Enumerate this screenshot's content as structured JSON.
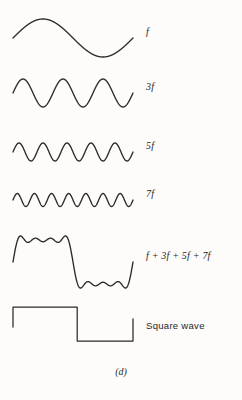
{
  "figure": {
    "caption": "(d)",
    "background_color": "#fdfcfa",
    "stroke_color": "#2a2a2a"
  },
  "chart_data": {
    "type": "line",
    "title": "",
    "subtitle": "",
    "xlabel": "",
    "ylabel": "",
    "grid": false,
    "legend_position": "right",
    "axis_visible": false,
    "x_range": [
      0,
      1
    ],
    "x_pixel_range": [
      13,
      133
    ],
    "traces": [
      {
        "name": "f",
        "label": "f",
        "label_style": "italic",
        "kind": "sine",
        "harmonics": [
          1
        ],
        "cycles": 1,
        "amplitude": 19,
        "baseline_y": 38,
        "label_x": 146,
        "label_y": 33
      },
      {
        "name": "3f",
        "label": "3f",
        "label_style": "italic",
        "kind": "sine",
        "harmonics": [
          3
        ],
        "cycles": 3,
        "amplitude": 14,
        "baseline_y": 93,
        "label_x": 146,
        "label_y": 88
      },
      {
        "name": "5f",
        "label": "5f",
        "label_style": "italic",
        "kind": "sine",
        "harmonics": [
          5
        ],
        "cycles": 5,
        "amplitude": 9,
        "baseline_y": 152,
        "label_x": 146,
        "label_y": 147
      },
      {
        "name": "7f",
        "label": "7f",
        "label_style": "italic",
        "kind": "sine",
        "harmonics": [
          7
        ],
        "cycles": 7,
        "amplitude": 6.5,
        "baseline_y": 200,
        "label_x": 146,
        "label_y": 195
      },
      {
        "name": "sum",
        "label": "f + 3f + 5f + 7f",
        "label_style": "italic",
        "kind": "fourier-sum",
        "harmonics": [
          1,
          3,
          5,
          7
        ],
        "cycles": 1,
        "amplitude": 28,
        "baseline_y": 262,
        "label_x": 146,
        "label_y": 257
      },
      {
        "name": "square",
        "label": "Square wave",
        "label_style": "sans",
        "kind": "square",
        "harmonics": [],
        "cycles": 1,
        "amplitude": 17,
        "baseline_y": 324,
        "label_x": 146,
        "label_y": 327
      }
    ]
  }
}
